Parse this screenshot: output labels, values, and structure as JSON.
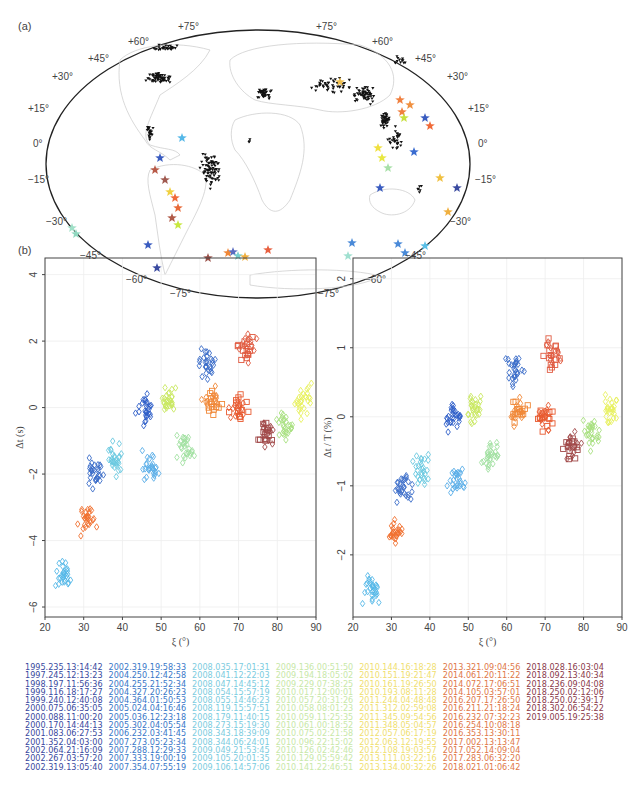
{
  "panels": {
    "a": {
      "label": "(a)"
    },
    "b": {
      "label": "(b)"
    },
    "c": {
      "label": "(c)"
    }
  },
  "map": {
    "lat_labels_left": [
      "+60°",
      "+45°",
      "+30°",
      "+15°",
      "0°",
      "−15°",
      "−30°",
      "−45°",
      "−60°",
      "−75°"
    ],
    "lat_labels_right": [
      "+60°",
      "+45°",
      "+30°",
      "+15°",
      "0°",
      "−15°",
      "−30°",
      "−45°",
      "−60°",
      "−75°"
    ],
    "top_labels": [
      "+75°",
      "+75°"
    ],
    "station_marker": "black inverted triangle",
    "event_marker": "star"
  },
  "chart_data": [
    {
      "type": "scatter",
      "panel": "b",
      "title": "",
      "xlabel": "ξ (°)",
      "ylabel": "Δt (s)",
      "xlim": [
        20,
        90
      ],
      "ylim": [
        -6.3,
        4.5
      ],
      "xticks": [
        20,
        30,
        40,
        50,
        60,
        70,
        80,
        90
      ],
      "yticks": [
        -6,
        -4,
        -2,
        0,
        2,
        4
      ],
      "grid": true,
      "markers": {
        "older_events": "diamond",
        "recent_events": "square"
      },
      "trend": "Δt rises from about -5 s near ξ=25° to ~0 s at ξ≈60–75°, then dips to ~-1 s around ξ≈78°",
      "clusters": [
        {
          "x": 25,
          "y": -5.0,
          "color": "#55b8e8"
        },
        {
          "x": 31,
          "y": -3.3,
          "color": "#f07030"
        },
        {
          "x": 33,
          "y": -2.0,
          "color": "#3a6cc8"
        },
        {
          "x": 38,
          "y": -1.5,
          "color": "#6ac8e0"
        },
        {
          "x": 46,
          "y": 0.0,
          "color": "#2f5fc8"
        },
        {
          "x": 47,
          "y": -1.8,
          "color": "#5aaee8"
        },
        {
          "x": 52,
          "y": 0.2,
          "color": "#c8e860"
        },
        {
          "x": 56,
          "y": -1.2,
          "color": "#a0e0a0"
        },
        {
          "x": 62,
          "y": 1.3,
          "color": "#3a6cc8"
        },
        {
          "x": 63,
          "y": 0.2,
          "color": "#f08838"
        },
        {
          "x": 70,
          "y": 0.0,
          "color": "#e85a30"
        },
        {
          "x": 72,
          "y": 1.8,
          "color": "#e05a40"
        },
        {
          "x": 77,
          "y": -0.8,
          "color": "#a04848"
        },
        {
          "x": 82,
          "y": -0.5,
          "color": "#a8e080"
        },
        {
          "x": 87,
          "y": 0.2,
          "color": "#e8f060"
        }
      ]
    },
    {
      "type": "scatter",
      "panel": "c",
      "title": "",
      "xlabel": "ξ (°)",
      "ylabel": "Δt / T (%)",
      "xlim": [
        20,
        90
      ],
      "ylim": [
        -2.9,
        2.3
      ],
      "xticks": [
        20,
        30,
        40,
        50,
        60,
        70,
        80,
        90
      ],
      "yticks": [
        -2,
        -1,
        0,
        1,
        2
      ],
      "grid": true,
      "markers": {
        "older_events": "diamond",
        "recent_events": "square"
      },
      "trend": "Δt/T rises from about -2.5% near ξ=25° to ~0% at ξ≈60–75°, then dips to ~-0.4% around ξ≈78°",
      "clusters": [
        {
          "x": 25,
          "y": -2.5,
          "color": "#55b8e8"
        },
        {
          "x": 31,
          "y": -1.7,
          "color": "#f07030"
        },
        {
          "x": 33,
          "y": -1.0,
          "color": "#3a6cc8"
        },
        {
          "x": 38,
          "y": -0.8,
          "color": "#6ac8e0"
        },
        {
          "x": 46,
          "y": 0.0,
          "color": "#2f5fc8"
        },
        {
          "x": 47,
          "y": -0.9,
          "color": "#5aaee8"
        },
        {
          "x": 52,
          "y": 0.1,
          "color": "#c8e860"
        },
        {
          "x": 56,
          "y": -0.6,
          "color": "#a0e0a0"
        },
        {
          "x": 62,
          "y": 0.7,
          "color": "#3a6cc8"
        },
        {
          "x": 63,
          "y": 0.1,
          "color": "#f08838"
        },
        {
          "x": 70,
          "y": 0.0,
          "color": "#e85a30"
        },
        {
          "x": 72,
          "y": 0.9,
          "color": "#e05a40"
        },
        {
          "x": 77,
          "y": -0.4,
          "color": "#a04848"
        },
        {
          "x": 82,
          "y": -0.25,
          "color": "#a8e080"
        },
        {
          "x": 87,
          "y": 0.1,
          "color": "#e8f060"
        }
      ]
    }
  ],
  "legend": {
    "columns": [
      {
        "color": "#3a4aa0",
        "events": [
          "1995.235.13:14:42",
          "1997.245.12:13:23",
          "1998.197.11:56:36",
          "1999.116.18:17:27",
          "1999.240.12:40:08",
          "2000.075.06:35:05",
          "2000.088.11:00:20",
          "2000.170.14:44:13",
          "2001.083.06:27:53",
          "2001.352.04:03:00",
          "2002.064.21:16:09",
          "2002.267.03:57:20",
          "2002.319.13:05:40"
        ]
      },
      {
        "color": "#3a78c8",
        "events": [
          "2002.319.19:58:33",
          "2004.250.12:42:58",
          "2004.255.21:52:34",
          "2004.327.20:26:23",
          "2004.364.01:50:53",
          "2005.024.04:16:46",
          "2005.036.12:23:18",
          "2005.302.04:05:54",
          "2006.232.03:41:45",
          "2007.273.05:23:34",
          "2007.288.12:29:33",
          "2007.333.19:00:19",
          "2007.354.07:55:19"
        ]
      },
      {
        "color": "#7ccce0",
        "events": [
          "2008.035.17:01:31",
          "2008.041.12:22:03",
          "2008.047.14:45:12",
          "2008.054.15:57:19",
          "2008.055.14:46:23",
          "2008.119.15:57:51",
          "2008.179.11:40:15",
          "2008.273.15:19:30",
          "2008.343.18:39:09",
          "2008.344.06:24:01",
          "2009.049.21:53:45",
          "2009.105.20:01:35",
          "2009.106.14:57:06"
        ]
      },
      {
        "color": "#c8e8a8",
        "events": [
          "2009.136.00:51:50",
          "2009.194.18:05:02",
          "2009.229.07:38:25",
          "2010.017.12:00:01",
          "2010.057.20:31:26",
          "2010.058.08:01:23",
          "2010.059.11:25:35",
          "2010.061.00:18:52",
          "2010.075.02:21:58",
          "2010.096.22:15:02",
          "2010.126.02:42:46",
          "2010.129.05:59:42",
          "2010.141.22:46:51"
        ]
      },
      {
        "color": "#f0e070",
        "events": [
          "2010.144.16:18:28",
          "2010.151.19:21:47",
          "2010.161.19:26:50",
          "2010.193.08:11:28",
          "2011.244.04:48:48",
          "2011.312.02:59:08",
          "2011.345.09:54:56",
          "2011.348.05:04:57",
          "2012.057.06:17:19",
          "2012.063.12:19:55",
          "2012.108.19:03:57",
          "2013.111.03:22:16",
          "2013.134.00:32:26"
        ]
      },
      {
        "color": "#e07848",
        "events": [
          "2013.321.09:04:56",
          "2014.061.20:11:22",
          "2014.072.17:06:51",
          "2014.105.03:57:01",
          "2016.207.17:26:50",
          "2016.211.21:18:24",
          "2016.232.07:32:23",
          "2016.254.10:08:18",
          "2016.353.13:30:11",
          "2017.002.13:13:47",
          "2017.052.14:09:04",
          "2017.283.06:32:20",
          "2018.021.01:06:42"
        ]
      },
      {
        "color": "#8a3a4a",
        "events": [
          "2018.028.16:03:04",
          "2018.092.13:40:34",
          "2018.236.09:04:08",
          "2018.250.02:12:06",
          "2018.250.02:39:17",
          "2018.302.06:54:22",
          "2019.005.19:25:38"
        ]
      }
    ]
  }
}
